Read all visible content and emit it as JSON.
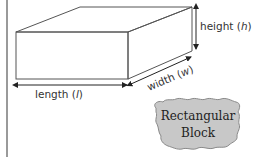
{
  "diagram": {
    "labels": {
      "height": "height (",
      "height_var": "h",
      "height_close": ")",
      "width": "width (",
      "width_var": "w",
      "width_close": ")",
      "length": "length (",
      "length_var": "l",
      "length_close": ")"
    },
    "callout": {
      "line1": "Rectangular",
      "line2": "Block"
    },
    "colors": {
      "edge": "#555555",
      "arrow": "#222222",
      "callout_fill": "#c8c8c8",
      "border": "#9a9a9a"
    }
  }
}
